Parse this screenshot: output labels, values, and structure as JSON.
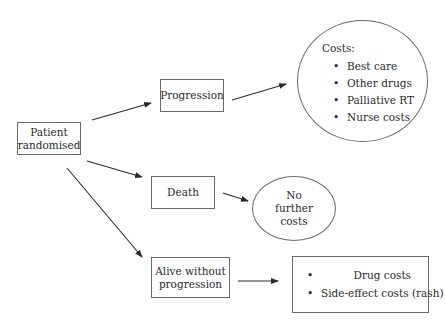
{
  "diagram": {
    "type": "flow-tree",
    "nodes": {
      "root": {
        "lines": [
          "Patient",
          "randomised"
        ]
      },
      "progression": {
        "lines": [
          "Progression"
        ]
      },
      "death": {
        "lines": [
          "Death"
        ]
      },
      "alive": {
        "lines": [
          "Alive without",
          "progression"
        ]
      },
      "progression_costs": {
        "heading": "Costs:",
        "items": [
          "Best care",
          "Other drugs",
          "Palliative RT",
          "Nurse costs"
        ]
      },
      "death_costs": {
        "lines": [
          "No",
          "further",
          "costs"
        ]
      },
      "alive_costs": {
        "items": [
          "Drug costs",
          "Side-effect costs (rash)"
        ]
      }
    },
    "edges": [
      {
        "from": "root",
        "to": "progression"
      },
      {
        "from": "root",
        "to": "death"
      },
      {
        "from": "root",
        "to": "alive"
      },
      {
        "from": "progression",
        "to": "progression_costs"
      },
      {
        "from": "death",
        "to": "death_costs"
      },
      {
        "from": "alive",
        "to": "alive_costs"
      }
    ],
    "colors": {
      "stroke": "#6a6a6a",
      "arrow": "#2a2a2a",
      "text": "#2a2a2a",
      "background": "#ffffff"
    }
  }
}
